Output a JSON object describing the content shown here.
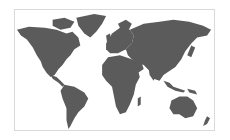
{
  "map": {
    "type": "world-map",
    "projection": "mercator",
    "land_color": "#5b5b5b",
    "background_color": "#ffffff",
    "border_color": "#d9d9d9",
    "regions": [
      "North America",
      "Greenland",
      "South America",
      "Europe",
      "Africa",
      "Asia",
      "Australia",
      "New Zealand",
      "Indonesia"
    ]
  }
}
